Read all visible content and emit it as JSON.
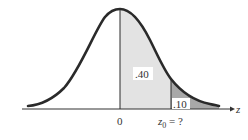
{
  "diagram": {
    "title": "",
    "type": "normal-distribution-curve",
    "axis_label": "z",
    "tick_zero": "0",
    "tick_z0": "z",
    "tick_z0_sub": "0",
    "tick_z0_suffix": " = ?",
    "area_center_label": ".40",
    "area_tail_label": ".10",
    "colors": {
      "curve": "#2a2a2a",
      "light_shade": "#e3e3e3",
      "dark_shade": "#a8a8a8",
      "axis": "#333333"
    }
  }
}
